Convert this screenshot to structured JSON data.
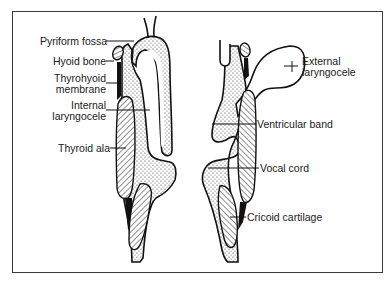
{
  "figure": {
    "left_labels": [
      {
        "id": "pyriform-fossa",
        "text": "Pyriform fossa"
      },
      {
        "id": "hyoid-bone",
        "text": "Hyoid bone"
      },
      {
        "id": "thyrohyoid-membrane",
        "text": "Thyrohyoid\nmembrane",
        "line1": "Thyrohyoid",
        "line2": "membrane"
      },
      {
        "id": "internal-laryngocele",
        "text": "Internal\nlaryngocele",
        "line1": "Internal",
        "line2": "laryngocele"
      },
      {
        "id": "thyroid-ala",
        "text": "Thyroid ala"
      }
    ],
    "right_labels": [
      {
        "id": "external-laryngocele",
        "text": "External\nlaryngocele",
        "line1": "External",
        "line2": "laryngocele"
      },
      {
        "id": "ventricular-band",
        "text": "Ventricular band"
      },
      {
        "id": "vocal-cord",
        "text": "Vocal cord"
      },
      {
        "id": "cricoid-cartilage",
        "text": "Cricoid cartilage"
      }
    ],
    "colors": {
      "stroke": "#111111",
      "frame": "#3a3a3a",
      "background": "#ffffff"
    }
  }
}
